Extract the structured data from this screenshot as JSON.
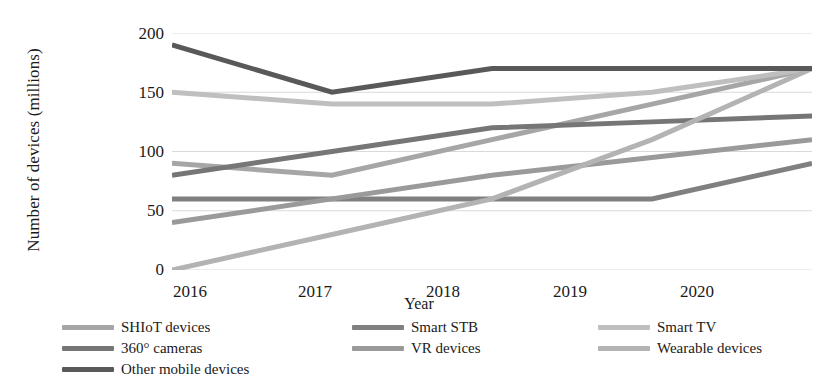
{
  "chart_data": {
    "type": "line",
    "title": "",
    "xlabel": "Year",
    "ylabel": "Number of devices (millions)",
    "categories": [
      "2016",
      "2017",
      "2018",
      "2019",
      "2020"
    ],
    "x": [
      2016,
      2017,
      2018,
      2019,
      2020
    ],
    "ylim": [
      0,
      200
    ],
    "yticks": [
      0,
      50,
      100,
      150,
      200
    ],
    "grid": true,
    "legend_position": "bottom",
    "series": [
      {
        "name": "SHIoT  devices",
        "values": [
          90,
          80,
          110,
          140,
          170
        ],
        "color": "#a6a6a6"
      },
      {
        "name": "Smart STB",
        "values": [
          60,
          60,
          60,
          60,
          90
        ],
        "color": "#808080"
      },
      {
        "name": "Smart TV",
        "values": [
          150,
          140,
          140,
          150,
          170
        ],
        "color": "#bfbfbf"
      },
      {
        "name": "360° cameras",
        "values": [
          80,
          100,
          120,
          125,
          130
        ],
        "color": "#767676"
      },
      {
        "name": "VR devices",
        "values": [
          40,
          60,
          80,
          95,
          110
        ],
        "color": "#9a9a9a"
      },
      {
        "name": "Wearable devices",
        "values": [
          0,
          30,
          60,
          110,
          170
        ],
        "color": "#b3b3b3"
      },
      {
        "name": "Other mobile devices",
        "values": [
          190,
          150,
          170,
          170,
          170
        ],
        "color": "#595959"
      }
    ]
  },
  "axis": {
    "y_title": "Number of devices (millions)",
    "x_title": "Year",
    "y_ticks": [
      "200",
      "150",
      "100",
      "50",
      "0"
    ],
    "x_ticks": [
      "2016",
      "2017",
      "2018",
      "2019",
      "2020"
    ]
  },
  "legend": {
    "columns": [
      {
        "entries": [
          {
            "label": "SHIoT  devices",
            "color": "#a6a6a6"
          },
          {
            "label": "360° cameras",
            "color": "#767676"
          },
          {
            "label": "Other mobile devices",
            "color": "#595959"
          }
        ]
      },
      {
        "entries": [
          {
            "label": "Smart STB",
            "color": "#808080"
          },
          {
            "label": "VR devices",
            "color": "#9a9a9a"
          }
        ]
      },
      {
        "entries": [
          {
            "label": "Smart TV",
            "color": "#bfbfbf"
          },
          {
            "label": "Wearable devices",
            "color": "#b3b3b3"
          }
        ]
      }
    ]
  },
  "style": {
    "background": "#ffffff",
    "gridline_color": "#d9d9d9",
    "text_color": "#1a1a1a"
  }
}
